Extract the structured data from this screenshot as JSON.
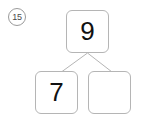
{
  "problem": {
    "number_label": "15",
    "marker_style": "circled"
  },
  "number_bond": {
    "whole": {
      "name": "whole",
      "value": "9",
      "empty": false
    },
    "parts": [
      {
        "name": "part-left",
        "value": "7",
        "empty": false
      },
      {
        "name": "part-right",
        "value": "",
        "empty": true
      }
    ]
  },
  "colors": {
    "box_border": "#b5b5b5",
    "connector_line": "#b5b5b5",
    "digit": "#111111",
    "marker_outline": "#9a9a9a",
    "marker_text": "#4a4a4a",
    "page_background": "#ffffff"
  }
}
